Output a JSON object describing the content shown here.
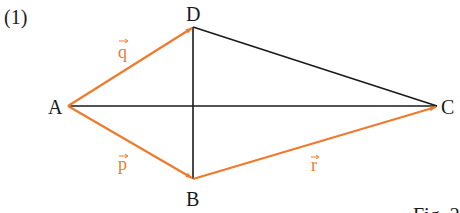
{
  "problem_number": "(1)",
  "figure_caption": "Fig. 2",
  "colors": {
    "line": "#1a1a1a",
    "vector": "#f07a2c",
    "background": "#ffffff"
  },
  "points": {
    "A": {
      "label": "A",
      "x": 68,
      "y": 106
    },
    "B": {
      "label": "B",
      "x": 193,
      "y": 179
    },
    "C": {
      "label": "C",
      "x": 437,
      "y": 106
    },
    "D": {
      "label": "D",
      "x": 193,
      "y": 27
    }
  },
  "segments": [
    {
      "from": "A",
      "to": "C",
      "style": "black"
    },
    {
      "from": "D",
      "to": "B",
      "style": "black"
    },
    {
      "from": "D",
      "to": "C",
      "style": "black"
    }
  ],
  "vectors": [
    {
      "name": "q",
      "label": "q",
      "from": "A",
      "to": "D"
    },
    {
      "name": "p",
      "label": "p",
      "from": "A",
      "to": "B"
    },
    {
      "name": "r",
      "label": "r",
      "from": "B",
      "to": "C"
    }
  ]
}
